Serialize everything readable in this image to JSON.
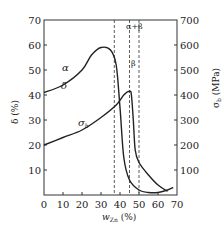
{
  "chart_data": {
    "type": "line",
    "title": "",
    "xlabel": "w_Zn (%)",
    "ylabel_left": "δ (%)",
    "ylabel_right": "σb (MPa)",
    "xlim": [
      0,
      70
    ],
    "ylim_left": [
      0,
      70
    ],
    "ylim_right": [
      0,
      700
    ],
    "x_ticks": [
      "0",
      "10",
      "20",
      "30",
      "40",
      "50",
      "60",
      "70"
    ],
    "y_ticks_left": [
      "10",
      "20",
      "30",
      "40",
      "50",
      "60",
      "70"
    ],
    "y_ticks_right": [
      "100",
      "200",
      "300",
      "400",
      "500",
      "600",
      "700"
    ],
    "grid": false,
    "series": [
      {
        "name": "δ",
        "axis": "left",
        "x": [
          0,
          10,
          20,
          25,
          30,
          35,
          38,
          40,
          42,
          45,
          50,
          55,
          60,
          65,
          68
        ],
        "values": [
          41,
          44,
          50,
          56,
          59,
          58,
          52,
          35,
          15,
          6,
          2,
          1,
          1,
          2,
          3
        ]
      },
      {
        "name": "σb",
        "axis": "right",
        "x": [
          0,
          10,
          20,
          30,
          38,
          42,
          45,
          46,
          47,
          48,
          50,
          55,
          60,
          65
        ],
        "values": [
          200,
          230,
          260,
          310,
          360,
          400,
          415,
          400,
          300,
          180,
          130,
          80,
          40,
          15
        ]
      }
    ],
    "phase_boundaries": [
      37,
      45,
      50
    ],
    "annotations": [
      "α",
      "δ",
      "σb",
      "α+β",
      "β"
    ]
  },
  "labels": {
    "alpha": "α",
    "delta": "δ",
    "sigma_b": "σ",
    "sigma_b_sub": "b",
    "alpha_beta": "α+β",
    "beta": "β",
    "ylabel_left": "δ (%)",
    "ylabel_right_main": "σ",
    "ylabel_right_sub": "b",
    "ylabel_right_unit": " (MPa)",
    "xlabel_main": "w",
    "xlabel_sub": "Zn",
    "xlabel_unit": " (%)"
  }
}
